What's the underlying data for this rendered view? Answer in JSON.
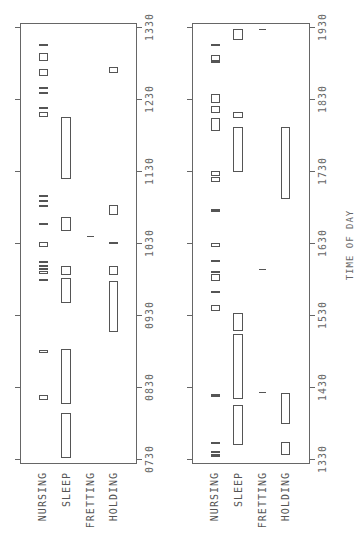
{
  "chart_data": {
    "type": "timeline",
    "orientation": "rotated 90deg counterclockwise (time axis vertical, increasing upward)",
    "xlabel": "TIME OF DAY",
    "categories": [
      "NURSING",
      "SLEEP",
      "FRETTING",
      "HOLDING"
    ],
    "panels": [
      {
        "id": "morning",
        "range": [
          "07:30",
          "13:30"
        ],
        "ticks": [
          "0730",
          "0830",
          "0930",
          "1030",
          "1130",
          "1230",
          "1330"
        ],
        "events": {
          "NURSING": [
            [
              "08:19",
              "08:23"
            ],
            [
              "08:58",
              "09:01"
            ],
            [
              "09:58",
              "10:00"
            ],
            [
              "10:04",
              "10:07"
            ],
            [
              "10:08",
              "10:09"
            ],
            [
              "10:10",
              "10:12"
            ],
            [
              "10:13",
              "10:15"
            ],
            [
              "10:27",
              "10:31"
            ],
            [
              "10:46",
              "10:47"
            ],
            [
              "11:01",
              "11:02"
            ],
            [
              "11:05",
              "11:06"
            ],
            [
              "11:09",
              "11:10"
            ],
            [
              "12:15",
              "12:19"
            ],
            [
              "12:22",
              "12:23"
            ],
            [
              "12:35",
              "12:36"
            ],
            [
              "12:39",
              "12:40"
            ],
            [
              "12:49",
              "12:55"
            ],
            [
              "13:02",
              "13:08"
            ],
            [
              "13:15",
              "13:16"
            ]
          ],
          "SLEEP": [
            [
              "07:31",
              "08:08"
            ],
            [
              "08:16",
              "09:02"
            ],
            [
              "09:40",
              "10:01"
            ],
            [
              "10:03",
              "10:11"
            ],
            [
              "10:40",
              "10:52"
            ],
            [
              "11:23",
              "12:15"
            ]
          ],
          "FRETTING": [
            [
              "10:35",
              "10:36"
            ]
          ],
          "HOLDING": [
            [
              "09:16",
              "09:58"
            ],
            [
              "10:03",
              "10:11"
            ],
            [
              "10:30",
              "10:31"
            ],
            [
              "10:53",
              "11:02"
            ],
            [
              "12:52",
              "12:57"
            ]
          ]
        }
      },
      {
        "id": "afternoon",
        "range": [
          "13:30",
          "19:30"
        ],
        "ticks": [
          "1330",
          "1430",
          "1530",
          "1630",
          "1730",
          "1830",
          "1930"
        ],
        "events": {
          "NURSING": [
            [
              "13:32",
              "13:34"
            ],
            [
              "13:35",
              "13:37"
            ],
            [
              "13:43",
              "13:44"
            ],
            [
              "14:22",
              "14:24"
            ],
            [
              "15:33",
              "15:38"
            ],
            [
              "15:48",
              "15:50"
            ],
            [
              "15:58",
              "16:04"
            ],
            [
              "16:05",
              "16:07"
            ],
            [
              "16:14",
              "16:16"
            ],
            [
              "16:27",
              "16:30"
            ],
            [
              "16:56",
              "16:58"
            ],
            [
              "17:21",
              "17:25"
            ],
            [
              "17:26",
              "17:30"
            ],
            [
              "18:03",
              "18:14"
            ],
            [
              "18:18",
              "18:24"
            ],
            [
              "18:27",
              "18:34"
            ],
            [
              "19:01",
              "19:02"
            ],
            [
              "19:02",
              "19:07"
            ],
            [
              "19:14",
              "19:16"
            ]
          ],
          "SLEEP": [
            [
              "13:42",
              "14:15"
            ],
            [
              "14:20",
              "15:14"
            ],
            [
              "15:17",
              "15:32"
            ],
            [
              "17:29",
              "18:07"
            ],
            [
              "18:14",
              "18:19"
            ],
            [
              "19:19",
              "19:28"
            ]
          ],
          "FRETTING": [
            [
              "14:25",
              "14:26"
            ],
            [
              "16:07",
              "16:08"
            ],
            [
              "19:27",
              "19:28"
            ]
          ],
          "HOLDING": [
            [
              "13:33",
              "13:44"
            ],
            [
              "13:59",
              "14:25"
            ],
            [
              "17:07",
              "18:07"
            ]
          ]
        }
      }
    ]
  },
  "axis": {
    "title": "TIME OF DAY"
  },
  "labels": {
    "nursing": "NURSING",
    "sleep": "SLEEP",
    "fretting": "FRETTING",
    "holding": "HOLDING"
  },
  "ticks_left": [
    "0730",
    "0830",
    "0930",
    "1030",
    "1130",
    "1230",
    "1330"
  ],
  "ticks_right": [
    "1330",
    "1430",
    "1530",
    "1630",
    "1730",
    "1830",
    "1930"
  ],
  "colors": {
    "ink": "#555555",
    "frame": "#666666",
    "background": "#ffffff"
  }
}
